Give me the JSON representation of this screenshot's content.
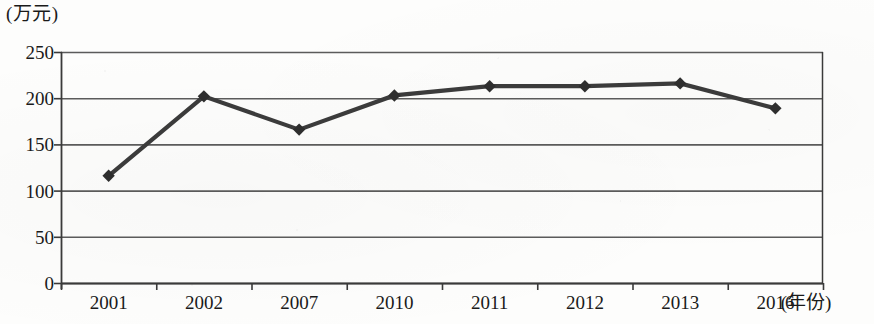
{
  "chart_data": {
    "type": "line",
    "title": "",
    "subtitle": "",
    "xlabel": "(年份)",
    "ylabel": "(万元)",
    "categories": [
      "2001",
      "2002",
      "2007",
      "2010",
      "2011",
      "2012",
      "2013",
      "2016"
    ],
    "values": [
      116,
      202,
      166,
      203,
      213,
      213,
      216,
      189
    ],
    "series": [
      {
        "name": "",
        "values": [
          116,
          202,
          166,
          203,
          213,
          213,
          216,
          189
        ]
      }
    ],
    "ylim": [
      0,
      250
    ],
    "ytick_labels": [
      "0",
      "50",
      "100",
      "150",
      "200",
      "250"
    ],
    "ytick_values": [
      0,
      50,
      100,
      150,
      200,
      250
    ],
    "xtick_labels": [
      "2001",
      "2002",
      "2007",
      "2010",
      "2011",
      "2012",
      "2013",
      "2016"
    ],
    "grid": true,
    "grid_axis": "y",
    "legend": false,
    "legend_position": "none",
    "marker": "diamond",
    "line_color": "#3b3b3b",
    "marker_color": "#2e2e2e",
    "grid_color": "#4a4a4a",
    "axis_color": "#3a3a3a",
    "annotations": []
  },
  "axes": {
    "y_unit_caption": "(万元)",
    "x_unit_caption": "(年份)"
  }
}
